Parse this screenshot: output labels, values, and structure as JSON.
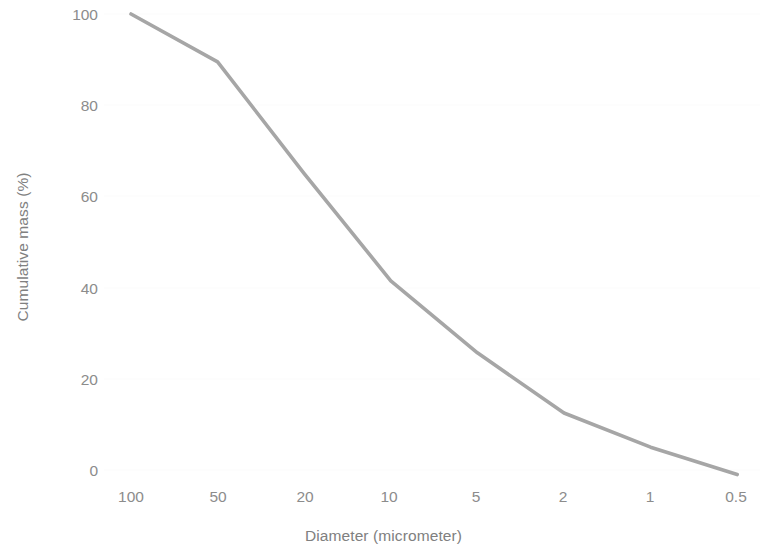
{
  "chart_data": {
    "type": "line",
    "title": "",
    "subtitle": "",
    "xlabel": "Diameter (micrometer)",
    "ylabel": "Cumulative mass (%)",
    "categories": [
      "100",
      "50",
      "20",
      "10",
      "5",
      "2",
      "1",
      "0.5"
    ],
    "values": [
      100,
      89.5,
      65,
      41.5,
      25.7,
      12.5,
      5,
      -1
    ],
    "series": [
      {
        "name": "Cumulative mass",
        "values": [
          100,
          89.5,
          65,
          41.5,
          25.7,
          12.5,
          5,
          -1
        ],
        "color": "#a6a6a6"
      }
    ],
    "x_tick_labels": [
      "100",
      "50",
      "20",
      "10",
      "5",
      "2",
      "1",
      "0.5"
    ],
    "y_tick_labels": [
      "100",
      "80",
      "60",
      "40",
      "20",
      "0"
    ],
    "y_ticks": [
      100,
      80,
      60,
      40,
      20,
      0
    ],
    "ylim": [
      0,
      100
    ],
    "grid": true,
    "grid_axis": "y",
    "legend": false,
    "legend_position": "none",
    "annotations": []
  },
  "style": {
    "line_color": "#a6a6a6",
    "text_color": "#808080",
    "tick_color": "#8c8c8c",
    "grid_color": "#fbfbfb",
    "background": "#ffffff"
  }
}
